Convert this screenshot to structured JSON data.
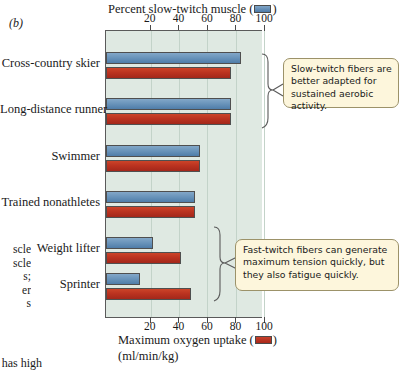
{
  "panel_letter": "(b)",
  "top_axis": {
    "title_before": "Percent slow-twitch muscle (",
    "title_after": ")",
    "swatch": "blue-legend-swatch",
    "ticks": [
      20,
      40,
      60,
      80,
      100
    ]
  },
  "bottom_axis": {
    "title_before": "Maximum oxygen uptake (",
    "title_after": ")",
    "swatch": "red-legend-swatch",
    "units": "(ml/min/kg)",
    "ticks": [
      20,
      40,
      60,
      80,
      100
    ]
  },
  "callouts": [
    {
      "id": "slow-twitch-callout",
      "text": "Slow-twitch fibers are better adapted for sustained aerobic activity."
    },
    {
      "id": "fast-twitch-callout",
      "text": "Fast-twitch fibers can generate maximum tension quickly, but they also fatigue quickly."
    }
  ],
  "bleed_text": {
    "lines": "scle\nscle\ns;\ner\ns",
    "bottom": "s has high"
  },
  "colors": {
    "blue": "#6b95bb",
    "red": "#bb3320",
    "plot_background": "#dfe9e2",
    "gridline": "#c3d3c9",
    "callout_fill": "#fdf6dc",
    "callout_border": "#9c9269",
    "axis": "#5a5a5a"
  },
  "chart_data": {
    "type": "bar",
    "orientation": "horizontal",
    "title": "",
    "categories": [
      "Cross-country skier",
      "Long-distance runner",
      "Swimmer",
      "Trained nonathletes",
      "Weight lifter",
      "Sprinter"
    ],
    "series": [
      {
        "name": "Percent slow-twitch muscle",
        "color": "#6b95bb",
        "axis": "top",
        "unit": "%",
        "values": [
          95,
          88,
          66,
          63,
          33,
          24
        ]
      },
      {
        "name": "Maximum oxygen uptake",
        "color": "#bb3320",
        "axis": "bottom",
        "unit": "ml/min/kg",
        "values": [
          88,
          88,
          66,
          63,
          53,
          60
        ]
      }
    ],
    "xlabel": "Percent slow-twitch muscle (top) / Maximum oxygen uptake ml/min/kg (bottom)",
    "ylabel": "",
    "xlim": [
      0,
      110
    ],
    "xticks": [
      20,
      40,
      60,
      80,
      100
    ],
    "grid": true,
    "legend_position": "axis-titles"
  }
}
